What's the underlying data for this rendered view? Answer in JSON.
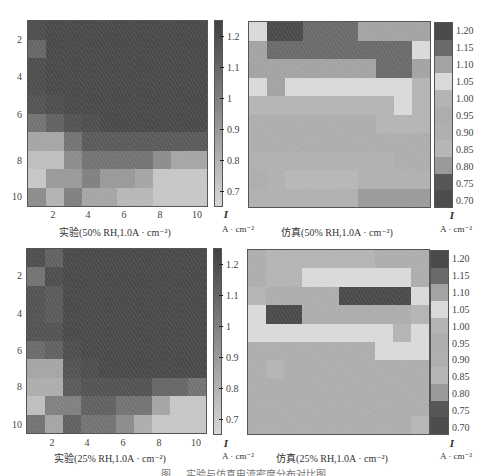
{
  "chart_data": [
    {
      "type": "heatmap",
      "title": "实验(50% RH,1.0A · cm⁻²)",
      "xlabel": "实验(50% RH,1.0A · cm⁻²)",
      "ylabel": "",
      "x_ticks": [
        "2",
        "4",
        "6",
        "8",
        "10"
      ],
      "y_ticks": [
        "2",
        "4",
        "6",
        "8",
        "10"
      ],
      "colorbar": {
        "label": "I",
        "unit": "A · cm⁻²",
        "ticks": [
          "1.2",
          "1.1",
          "1",
          "0.9",
          "0.8",
          "0.7"
        ],
        "range": [
          0.65,
          1.25
        ],
        "style": "continuous"
      },
      "grid": [
        [
          1.2,
          1.22,
          1.22,
          1.22,
          1.22,
          1.22,
          1.22,
          1.22,
          1.22,
          1.22
        ],
        [
          1.1,
          1.22,
          1.22,
          1.22,
          1.22,
          1.22,
          1.22,
          1.22,
          1.22,
          1.22
        ],
        [
          1.2,
          1.22,
          1.22,
          1.22,
          1.22,
          1.22,
          1.22,
          1.22,
          1.22,
          1.22
        ],
        [
          1.2,
          1.22,
          1.22,
          1.22,
          1.22,
          1.22,
          1.22,
          1.22,
          1.22,
          1.22
        ],
        [
          1.18,
          1.2,
          1.22,
          1.22,
          1.22,
          1.22,
          1.22,
          1.22,
          1.22,
          1.22
        ],
        [
          1.05,
          1.12,
          1.18,
          1.2,
          1.22,
          1.22,
          1.22,
          1.22,
          1.22,
          1.22
        ],
        [
          0.85,
          0.85,
          1.05,
          1.15,
          1.15,
          1.15,
          1.15,
          1.15,
          1.15,
          1.15
        ],
        [
          0.75,
          0.75,
          0.95,
          1.05,
          1.05,
          1.05,
          1.05,
          0.95,
          0.85,
          0.85
        ],
        [
          0.72,
          0.9,
          0.9,
          1.0,
          0.9,
          0.9,
          0.85,
          0.72,
          0.72,
          0.72
        ],
        [
          0.95,
          0.8,
          1.0,
          0.85,
          0.85,
          0.78,
          0.78,
          0.72,
          0.72,
          0.72
        ]
      ]
    },
    {
      "type": "heatmap",
      "title": "仿真(50% RH,1.0A · cm⁻²)",
      "xlabel": "仿真(50% RH,1.0A · cm⁻²)",
      "colorbar": {
        "label": "I",
        "unit": "A · cm⁻²",
        "ticks": [
          "1.20",
          "1.15",
          "1.10",
          "1.05",
          "1.00",
          "0.95",
          "0.90",
          "0.85",
          "0.80",
          "0.75",
          "0.70"
        ],
        "style": "discrete"
      },
      "grid": [
        [
          1.05,
          1.2,
          1.2,
          1.15,
          1.15,
          1.15,
          1.1,
          1.1,
          1.1,
          1.1
        ],
        [
          1.1,
          1.15,
          1.15,
          1.15,
          1.15,
          1.15,
          1.15,
          1.15,
          1.15,
          1.05
        ],
        [
          1.1,
          1.1,
          1.1,
          1.1,
          1.1,
          1.1,
          1.1,
          1.15,
          1.15,
          1.1
        ],
        [
          1.05,
          1.1,
          1.05,
          1.05,
          1.05,
          1.05,
          1.05,
          1.05,
          1.05,
          1.0
        ],
        [
          1.0,
          1.0,
          1.0,
          1.0,
          1.0,
          1.0,
          1.0,
          1.0,
          1.05,
          1.0
        ],
        [
          0.95,
          0.95,
          0.95,
          0.95,
          0.95,
          0.95,
          0.95,
          1.0,
          1.0,
          1.0
        ],
        [
          0.95,
          0.95,
          0.95,
          0.95,
          0.95,
          0.95,
          0.95,
          0.95,
          0.95,
          0.95
        ],
        [
          0.9,
          0.9,
          0.9,
          0.9,
          0.9,
          0.9,
          0.9,
          0.9,
          0.95,
          0.95
        ],
        [
          0.95,
          0.9,
          0.85,
          0.85,
          0.85,
          0.85,
          0.9,
          0.9,
          0.9,
          0.9
        ],
        [
          0.9,
          0.9,
          0.9,
          0.9,
          0.9,
          0.9,
          0.8,
          0.8,
          0.8,
          0.8
        ]
      ]
    },
    {
      "type": "heatmap",
      "title": "实验(25% RH,1.0A · cm⁻²)",
      "xlabel": "实验(25% RH,1.0A · cm⁻²)",
      "x_ticks": [
        "2",
        "4",
        "6",
        "8",
        "10"
      ],
      "y_ticks": [
        "2",
        "4",
        "6",
        "8",
        "10"
      ],
      "colorbar": {
        "label": "I",
        "unit": "A · cm⁻²",
        "ticks": [
          "1.2",
          "1.1",
          "1",
          "0.9",
          "0.8",
          "0.7"
        ],
        "range": [
          0.65,
          1.25
        ],
        "style": "continuous"
      },
      "grid": [
        [
          1.2,
          1.12,
          1.22,
          1.22,
          1.22,
          1.22,
          1.22,
          1.22,
          1.22,
          1.22
        ],
        [
          1.05,
          1.2,
          1.22,
          1.22,
          1.22,
          1.22,
          1.22,
          1.22,
          1.22,
          1.22
        ],
        [
          1.18,
          1.15,
          1.22,
          1.22,
          1.22,
          1.22,
          1.22,
          1.22,
          1.22,
          1.22
        ],
        [
          1.18,
          1.15,
          1.22,
          1.22,
          1.22,
          1.22,
          1.22,
          1.22,
          1.22,
          1.22
        ],
        [
          1.18,
          1.18,
          1.22,
          1.22,
          1.22,
          1.22,
          1.22,
          1.22,
          1.22,
          1.22
        ],
        [
          1.08,
          1.12,
          1.2,
          1.22,
          1.22,
          1.22,
          1.22,
          1.22,
          1.22,
          1.22
        ],
        [
          0.85,
          0.85,
          1.18,
          1.2,
          1.22,
          1.22,
          1.22,
          1.22,
          1.22,
          1.22
        ],
        [
          0.82,
          0.82,
          1.15,
          1.18,
          1.18,
          1.18,
          1.18,
          1.1,
          1.1,
          1.05
        ],
        [
          0.75,
          1.0,
          1.0,
          1.12,
          1.12,
          1.05,
          1.05,
          0.85,
          0.72,
          0.72
        ],
        [
          1.05,
          0.85,
          1.12,
          1.05,
          1.05,
          0.95,
          0.82,
          0.72,
          0.72,
          0.72
        ]
      ]
    },
    {
      "type": "heatmap",
      "title": "仿真(25% RH,1.0A · cm⁻²)",
      "xlabel": "仿真(25% RH,1.0A · cm⁻²)",
      "colorbar": {
        "label": "I",
        "unit": "A · cm⁻²",
        "ticks": [
          "1.20",
          "1.15",
          "1.10",
          "1.05",
          "1.00",
          "0.95",
          "0.90",
          "0.85",
          "0.80",
          "0.75",
          "0.70"
        ],
        "style": "discrete"
      },
      "grid": [
        [
          0.95,
          1.0,
          1.0,
          1.0,
          1.0,
          1.0,
          1.0,
          0.95,
          0.95,
          0.95
        ],
        [
          0.95,
          1.0,
          1.0,
          1.05,
          1.05,
          1.05,
          1.05,
          1.05,
          1.05,
          0.95
        ],
        [
          1.0,
          0.95,
          0.95,
          0.95,
          0.95,
          1.2,
          1.2,
          1.2,
          1.2,
          1.05
        ],
        [
          1.05,
          1.2,
          1.2,
          0.95,
          0.95,
          0.95,
          0.95,
          0.95,
          0.95,
          1.0
        ],
        [
          1.05,
          1.05,
          1.05,
          1.05,
          1.05,
          1.05,
          1.05,
          1.05,
          1.0,
          1.05
        ],
        [
          0.95,
          0.95,
          0.95,
          0.95,
          0.95,
          0.95,
          0.95,
          1.05,
          1.05,
          1.05
        ],
        [
          0.95,
          1.0,
          0.95,
          0.95,
          0.95,
          0.95,
          0.95,
          0.95,
          0.95,
          0.95
        ],
        [
          0.95,
          0.95,
          0.95,
          0.95,
          0.95,
          0.95,
          0.95,
          0.95,
          0.95,
          0.95
        ],
        [
          0.95,
          0.95,
          0.95,
          0.95,
          0.95,
          0.95,
          0.95,
          0.95,
          0.95,
          0.95
        ],
        [
          0.95,
          0.95,
          0.95,
          0.95,
          0.95,
          0.95,
          0.95,
          0.95,
          0.95,
          0.85
        ]
      ]
    }
  ],
  "labels": {
    "plot1_xlabel": "实验(50% RH,1.0A · cm⁻²)",
    "plot2_xlabel": "仿真(50% RH,1.0A · cm⁻²)",
    "plot3_xlabel": "实验(25% RH,1.0A · cm⁻²)",
    "plot4_xlabel": "仿真(25% RH,1.0A · cm⁻²)",
    "unit_symbol": "I",
    "unit_text": "A · cm⁻²",
    "tick_2": "2",
    "tick_4": "4",
    "tick_6": "6",
    "tick_8": "8",
    "tick_10": "10",
    "cont_ticks": [
      "1.2",
      "1.1",
      "1",
      "0.9",
      "0.8",
      "0.7"
    ],
    "disc_ticks": [
      "1.20",
      "1.15",
      "1.10",
      "1.05",
      "1.00",
      "0.95",
      "0.90",
      "0.85",
      "0.80",
      "0.75",
      "0.70"
    ]
  },
  "discrete_colors": [
    "#4a4a4a",
    "#6a6a6a",
    "#a3a3a3",
    "#d9d9d9",
    "#b4b4b4",
    "#adadad",
    "#b0b0b0",
    "#b6b6b6",
    "#9a9a9a",
    "#575757",
    "#4c4c4c"
  ],
  "caption": "图 … 实验与仿真电流密度分布对比图"
}
